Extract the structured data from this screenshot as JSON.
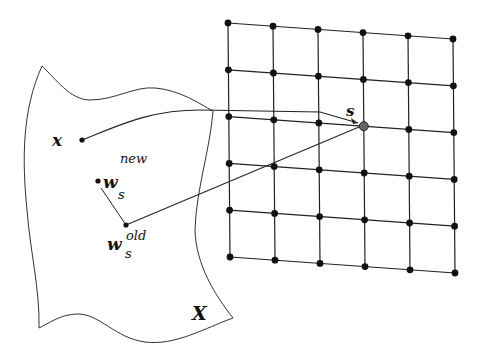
{
  "diagram": {
    "type": "self-organizing-map-update",
    "input_space": {
      "label": "X",
      "points": {
        "x": {
          "label": "x",
          "pos": [
            82,
            140
          ]
        },
        "w_new": {
          "label": "w",
          "sub": "s",
          "sup": "new",
          "pos": [
            98,
            181
          ]
        },
        "w_old": {
          "label": "w",
          "sub": "s",
          "sup": "old",
          "pos": [
            126,
            225
          ]
        }
      }
    },
    "lattice": {
      "rows": 6,
      "cols": 6,
      "corners": {
        "tl": [
          228,
          23
        ],
        "tr": [
          453,
          39
        ],
        "bl": [
          230,
          257
        ],
        "br": [
          455,
          273
        ]
      },
      "winner": {
        "label": "s",
        "row": 2,
        "col": 3
      }
    },
    "colors": {
      "stroke": "#222222",
      "node": "#111111",
      "winner": "#666666",
      "background": "#ffffff"
    }
  }
}
